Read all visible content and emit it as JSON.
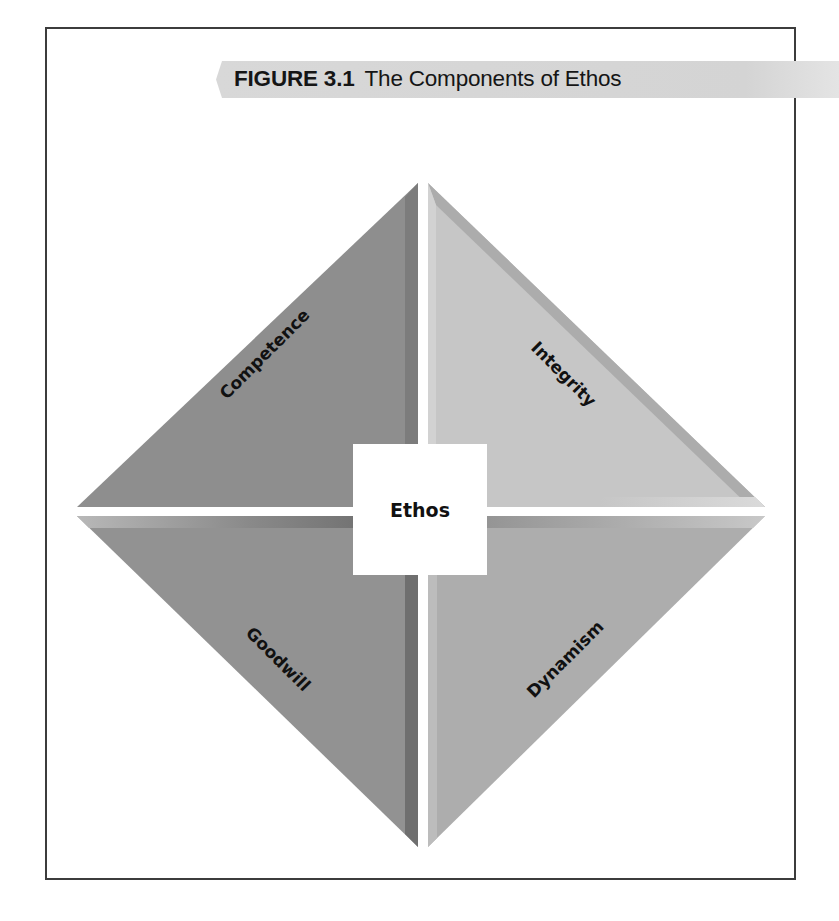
{
  "figure": {
    "number": "FIGURE 3.1",
    "title": "The Components of Ethos"
  },
  "diagram": {
    "center": "Ethos",
    "quadrants": [
      {
        "position": "top-left",
        "label": "Competence",
        "color": "#8e8e8e"
      },
      {
        "position": "top-right",
        "label": "Integrity",
        "color": "#c6c6c6"
      },
      {
        "position": "bottom-left",
        "label": "Goodwill",
        "color": "#929292"
      },
      {
        "position": "bottom-right",
        "label": "Dynamism",
        "color": "#adadad"
      }
    ]
  },
  "colors": {
    "banner": "#d6d6d6",
    "frame_border": "#3c3c3c"
  }
}
